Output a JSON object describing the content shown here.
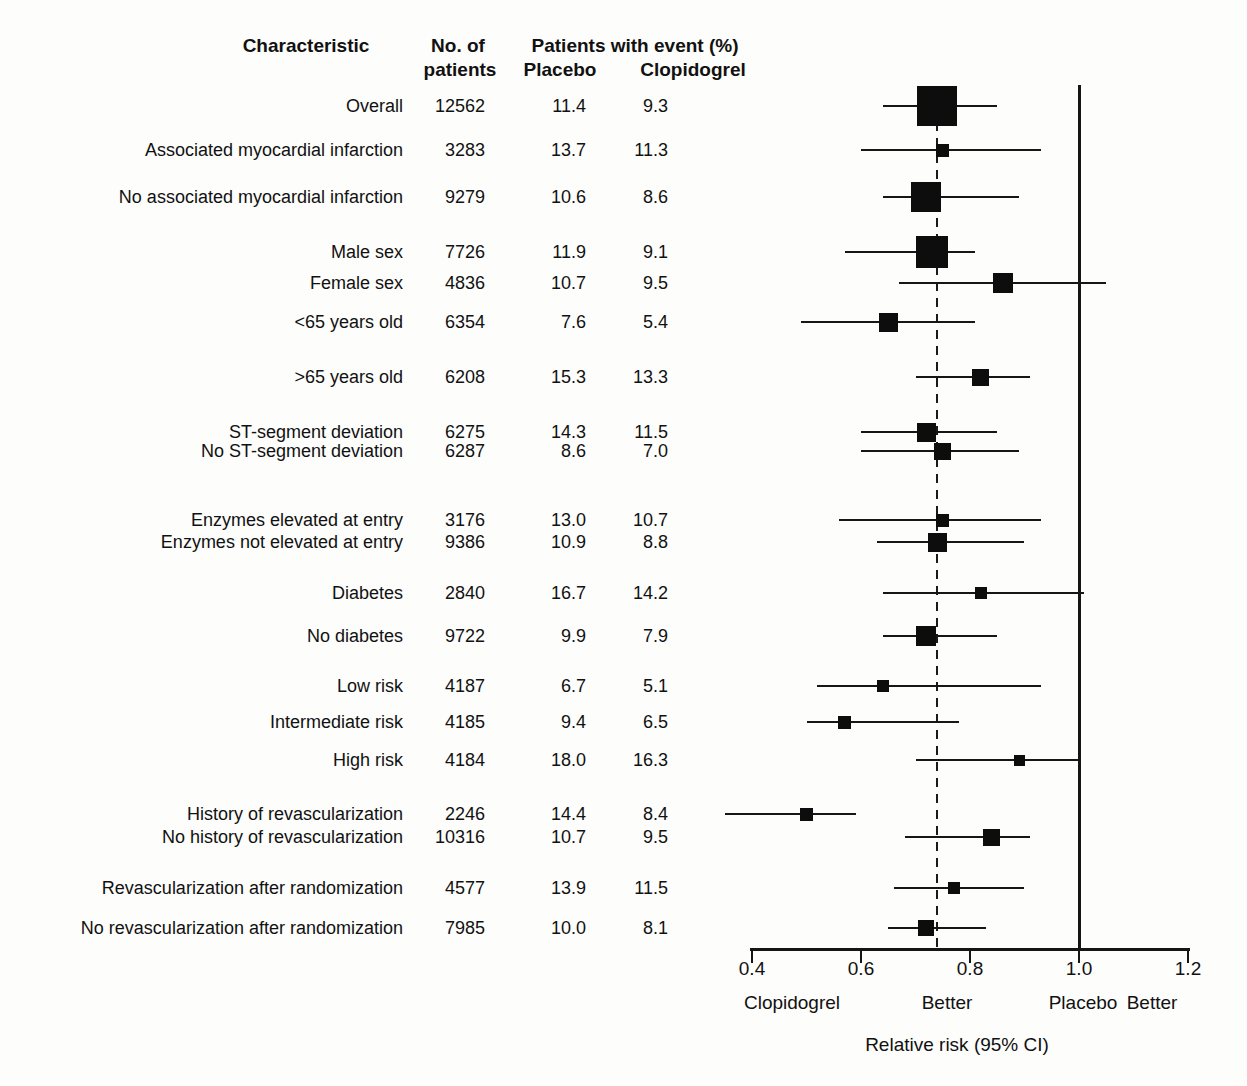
{
  "chart_data": {
    "type": "forest",
    "title": "",
    "header": {
      "characteristic": "Characteristic",
      "n_line1": "No. of",
      "n_line2": "patients",
      "events": "Patients with event (%)",
      "placebo": "Placebo",
      "clopidogrel": "Clopidogrel"
    },
    "axis": {
      "min": 0.4,
      "max": 1.2,
      "ticks": [
        0.4,
        0.6,
        0.8,
        1.0,
        1.2
      ],
      "tick_labels": [
        "0.4",
        "0.6",
        "0.8",
        "1.0",
        "1.2"
      ],
      "xlabel": "Relative risk (95% CI)",
      "reference_line": 1.0,
      "dashed_line_at": 0.74,
      "left_annotation_1": "Clopidogrel",
      "left_annotation_2": "Better",
      "right_annotation_1": "Placebo",
      "right_annotation_2": "Better",
      "grid": false,
      "legend": "none"
    },
    "rows": [
      {
        "label": "Overall",
        "n": "12562",
        "placebo": "11.4",
        "clopidogrel": "9.3",
        "rr": 0.74,
        "ci_low": 0.64,
        "ci_high": 0.85,
        "marker_size": 40,
        "y": 106
      },
      {
        "label": "Associated myocardial infarction",
        "n": "3283",
        "placebo": "13.7",
        "clopidogrel": "11.3",
        "rr": 0.75,
        "ci_low": 0.6,
        "ci_high": 0.93,
        "marker_size": 13,
        "y": 150
      },
      {
        "label": "No associated myocardial infarction",
        "n": "9279",
        "placebo": "10.6",
        "clopidogrel": "8.6",
        "rr": 0.72,
        "ci_low": 0.64,
        "ci_high": 0.89,
        "marker_size": 30,
        "y": 197
      },
      {
        "label": "Male sex",
        "n": "7726",
        "placebo": "11.9",
        "clopidogrel": "9.1",
        "rr": 0.73,
        "ci_low": 0.57,
        "ci_high": 0.81,
        "marker_size": 32,
        "y": 252
      },
      {
        "label": "Female sex",
        "n": "4836",
        "placebo": "10.7",
        "clopidogrel": "9.5",
        "rr": 0.86,
        "ci_low": 0.67,
        "ci_high": 1.05,
        "marker_size": 20,
        "y": 283
      },
      {
        "label": "<65 years old",
        "n": "6354",
        "placebo": "7.6",
        "clopidogrel": "5.4",
        "rr": 0.65,
        "ci_low": 0.49,
        "ci_high": 0.81,
        "marker_size": 19,
        "y": 322
      },
      {
        "label": ">65 years old",
        "n": "6208",
        "placebo": "15.3",
        "clopidogrel": "13.3",
        "rr": 0.82,
        "ci_low": 0.7,
        "ci_high": 0.91,
        "marker_size": 17,
        "y": 377
      },
      {
        "label": "ST-segment deviation",
        "n": "6275",
        "placebo": "14.3",
        "clopidogrel": "11.5",
        "rr": 0.72,
        "ci_low": 0.6,
        "ci_high": 0.85,
        "marker_size": 19,
        "y": 432
      },
      {
        "label": "No ST-segment deviation",
        "n": "6287",
        "placebo": "8.6",
        "clopidogrel": "7.0",
        "rr": 0.75,
        "ci_low": 0.6,
        "ci_high": 0.89,
        "marker_size": 17,
        "y": 451
      },
      {
        "label": "Enzymes elevated at entry",
        "n": "3176",
        "placebo": "13.0",
        "clopidogrel": "10.7",
        "rr": 0.75,
        "ci_low": 0.56,
        "ci_high": 0.93,
        "marker_size": 13,
        "y": 520
      },
      {
        "label": "Enzymes not elevated at entry",
        "n": "9386",
        "placebo": "10.9",
        "clopidogrel": "8.8",
        "rr": 0.74,
        "ci_low": 0.63,
        "ci_high": 0.9,
        "marker_size": 19,
        "y": 542
      },
      {
        "label": "Diabetes",
        "n": "2840",
        "placebo": "16.7",
        "clopidogrel": "14.2",
        "rr": 0.82,
        "ci_low": 0.64,
        "ci_high": 1.01,
        "marker_size": 12,
        "y": 593
      },
      {
        "label": "No diabetes",
        "n": "9722",
        "placebo": "9.9",
        "clopidogrel": "7.9",
        "rr": 0.72,
        "ci_low": 0.64,
        "ci_high": 0.85,
        "marker_size": 20,
        "y": 636
      },
      {
        "label": "Low risk",
        "n": "4187",
        "placebo": "6.7",
        "clopidogrel": "5.1",
        "rr": 0.64,
        "ci_low": 0.52,
        "ci_high": 0.93,
        "marker_size": 12,
        "y": 686
      },
      {
        "label": "Intermediate risk",
        "n": "4185",
        "placebo": "9.4",
        "clopidogrel": "6.5",
        "rr": 0.57,
        "ci_low": 0.5,
        "ci_high": 0.78,
        "marker_size": 13,
        "y": 722
      },
      {
        "label": "High risk",
        "n": "4184",
        "placebo": "18.0",
        "clopidogrel": "16.3",
        "rr": 0.89,
        "ci_low": 0.7,
        "ci_high": 1.0,
        "marker_size": 11,
        "y": 760
      },
      {
        "label": "History of revascularization",
        "n": "2246",
        "placebo": "14.4",
        "clopidogrel": "8.4",
        "rr": 0.5,
        "ci_low": 0.35,
        "ci_high": 0.59,
        "marker_size": 13,
        "y": 814
      },
      {
        "label": "No history of revascularization",
        "n": "10316",
        "placebo": "10.7",
        "clopidogrel": "9.5",
        "rr": 0.84,
        "ci_low": 0.68,
        "ci_high": 0.91,
        "marker_size": 17,
        "y": 837
      },
      {
        "label": "Revascularization after randomization",
        "n": "4577",
        "placebo": "13.9",
        "clopidogrel": "11.5",
        "rr": 0.77,
        "ci_low": 0.66,
        "ci_high": 0.9,
        "marker_size": 12,
        "y": 888
      },
      {
        "label": "No revascularization after randomization",
        "n": "7985",
        "placebo": "10.0",
        "clopidogrel": "8.1",
        "rr": 0.72,
        "ci_low": 0.65,
        "ci_high": 0.83,
        "marker_size": 16,
        "y": 928
      }
    ]
  }
}
